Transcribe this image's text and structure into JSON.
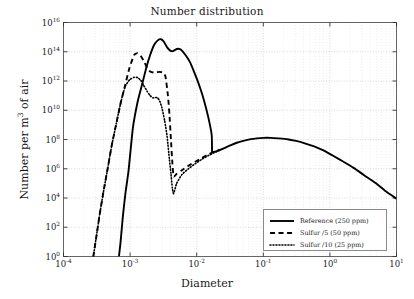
{
  "chart_data": {
    "type": "line",
    "title": "Number distribution",
    "xlabel": "Diameter",
    "ylabel": "Number per m3 of air",
    "ylabel_parts": {
      "prefix": "Number per m",
      "sup": "3",
      "suffix": " of air"
    },
    "xscale": "log",
    "yscale": "log",
    "xlim": [
      0.0001,
      10
    ],
    "ylim": [
      1,
      1e+16
    ],
    "grid": true,
    "grid_style": "dotted",
    "legend_position": "lower right",
    "xticks": [
      0.0001,
      0.001,
      0.01,
      0.1,
      1,
      10
    ],
    "xtick_labels": [
      "10-4",
      "10-3",
      "10-2",
      "10-1",
      "10 0",
      "10 1"
    ],
    "xtick_exponents": [
      "-4",
      "-3",
      "-2",
      "-1",
      "0",
      "1"
    ],
    "yticks": [
      1,
      100,
      10000,
      1000000,
      100000000,
      10000000000,
      1000000000000,
      100000000000000,
      1e+16
    ],
    "ytick_exponents": [
      "0",
      "2",
      "4",
      "6",
      "8",
      "10",
      "12",
      "14",
      "16"
    ],
    "series": [
      {
        "name": "Reference (250 ppm)",
        "style": "solid",
        "color": "#000000",
        "width": 1.9,
        "x": [
          0.00068,
          0.00072,
          0.00078,
          0.00085,
          0.00095,
          0.0011,
          0.0013,
          0.0015,
          0.00175,
          0.002,
          0.0023,
          0.0026,
          0.0029,
          0.0032,
          0.0036,
          0.004,
          0.0044,
          0.0048,
          0.0052,
          0.0056,
          0.006,
          0.0066,
          0.0072,
          0.008,
          0.009,
          0.01,
          0.0115,
          0.013,
          0.015,
          0.0168,
          0.017,
          0.0175,
          0.019,
          0.022,
          0.026,
          0.032,
          0.04,
          0.05,
          0.065,
          0.08,
          0.1,
          0.13,
          0.17,
          0.23,
          0.31,
          0.42,
          0.58,
          0.8,
          1.1,
          1.6,
          2.3,
          3.3,
          4.8,
          6.8,
          10.0
        ],
        "y": [
          1.0,
          10.0,
          600.0,
          20000.0,
          800000.0,
          600000000.0,
          40000000000.0,
          500000000000.0,
          8000000000000.0,
          60000000000000.0,
          300000000000000.0,
          600000000000000.0,
          720000000000000.0,
          500000000000000.0,
          200000000000000.0,
          120000000000000.0,
          110000000000000.0,
          140000000000000.0,
          160000000000000.0,
          150000000000000.0,
          120000000000000.0,
          70000000000000.0,
          40000000000000.0,
          18000000000000.0,
          5000000000000.0,
          1500000000000.0,
          250000000000.0,
          40000000000.0,
          3000000000.0,
          200000000.0,
          15000000.0,
          14000000.0,
          15000000.0,
          19000000.0,
          26000000.0,
          40000000.0,
          60000000.0,
          80000000.0,
          105000000.0,
          120000000.0,
          130000000.0,
          130000000.0,
          120000000.0,
          105000000.0,
          80000000.0,
          55000000.0,
          34000000.0,
          18000000.0,
          8000000.0,
          3000000.0,
          1100000.0,
          350000.0,
          110000.0,
          30000.0,
          9000.0
        ]
      },
      {
        "name": "Sulfur /5 (50 ppm)",
        "style": "dashed",
        "color": "#000000",
        "width": 1.9,
        "x": [
          0.00028,
          0.00031,
          0.00035,
          0.0004,
          0.00046,
          0.00053,
          0.00062,
          0.00072,
          0.00084,
          0.00098,
          0.00115,
          0.0013,
          0.00145,
          0.0016,
          0.0018,
          0.002,
          0.00225,
          0.0025,
          0.0028,
          0.0031,
          0.0034,
          0.0037,
          0.0039,
          0.0041,
          0.0043,
          0.0045,
          0.005,
          0.006,
          0.0075,
          0.0095,
          0.012,
          0.015,
          0.018,
          0.022
        ],
        "y": [
          1.0,
          20.0,
          800.0,
          30000.0,
          1000000.0,
          40000000.0,
          1200000000.0,
          30000000000.0,
          500000000000.0,
          8000000000000.0,
          60000000000000.0,
          80000000000000.0,
          50000000000000.0,
          24000000000000.0,
          8000000000000.0,
          4500000000000.0,
          3800000000000.0,
          4000000000000.0,
          4200000000000.0,
          3800000000000.0,
          2000000000000.0,
          100000000000.0,
          5000000000.0,
          100000000.0,
          3000000.0,
          300000.0,
          450000.0,
          800000.0,
          1600000.0,
          3000000.0,
          5500000.0,
          9500000.0,
          14000000.0,
          20000000.0
        ]
      },
      {
        "name": "Sulfur /10 (25 ppm)",
        "style": "dotted",
        "color": "#000000",
        "width": 1.6,
        "x": [
          0.00028,
          0.00031,
          0.00035,
          0.0004,
          0.00046,
          0.00053,
          0.00062,
          0.00072,
          0.00084,
          0.00098,
          0.00115,
          0.0013,
          0.00145,
          0.0016,
          0.0018,
          0.002,
          0.0022,
          0.0024,
          0.0026,
          0.0028,
          0.003,
          0.0033,
          0.0036,
          0.0039,
          0.0041,
          0.0043,
          0.0045,
          0.005,
          0.006,
          0.0075,
          0.0095,
          0.012,
          0.015,
          0.018,
          0.022
        ],
        "y": [
          1.0,
          20.0,
          800.0,
          30000.0,
          1000000.0,
          40000000.0,
          1200000000.0,
          30000000000.0,
          400000000000.0,
          1200000000000.0,
          1800000000000.0,
          1700000000000.0,
          1100000000000.0,
          500000000000.0,
          200000000000.0,
          100000000000.0,
          70000000000.0,
          75000000000.0,
          70000000000.0,
          40000000000.0,
          15000000000.0,
          2000000000.0,
          150000000.0,
          4000000.0,
          500000.0,
          50000.0,
          20000.0,
          100000.0,
          400000.0,
          1000000.0,
          2200000.0,
          4500000.0,
          8000000.0,
          12000000.0,
          18000000.0
        ]
      }
    ]
  },
  "legend": {
    "entries": [
      {
        "label": "Reference (250 ppm)",
        "style": "solid"
      },
      {
        "label": "Sulfur /5 (50 ppm)",
        "style": "dashed"
      },
      {
        "label": "Sulfur /10 (25 ppm)",
        "style": "dotted"
      }
    ]
  }
}
